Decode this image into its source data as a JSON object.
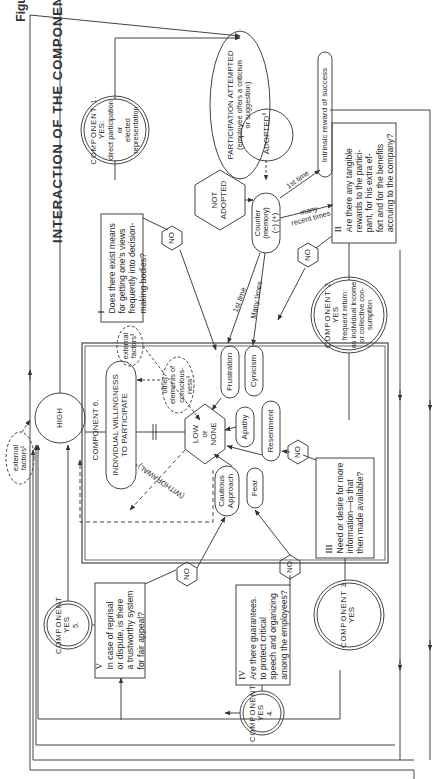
{
  "figure": {
    "label": "Figure 10.1",
    "title": "INTERACTION OF THE COMPONENTS"
  },
  "components": {
    "c1": {
      "arc": "COMPONENT 1.",
      "yes": "YES:",
      "lines": [
        "direct participation",
        "or",
        "elected",
        "representation"
      ]
    },
    "c2": {
      "arc": "COMPONENT 2",
      "yes": "YES",
      "lines": [
        "frequent return:",
        "as individual income",
        "or collective con-",
        "sumption"
      ]
    },
    "c3": {
      "arc": "COMPONENT 3",
      "yes": "YES"
    },
    "c4": {
      "arc": "COMPONENT",
      "yes": "YES",
      "num": "4."
    },
    "c5": {
      "arc": "COMPONENT",
      "yes": "YES",
      "num": "5."
    },
    "c6": {
      "label": "COMPONENT 6.",
      "box_line1": "INDIVIDUAL WILLINGNESS",
      "box_line2": "TO PARTICIPATE"
    }
  },
  "nodes": {
    "participation": {
      "line1": "PARTICIPATION ATTEMPTED",
      "line2": "(employee offers a criticism",
      "line3": "or suggestion)"
    },
    "adopted": "ADOPTED",
    "not_adopted": {
      "line1": "NOT",
      "line2": "ADOPTED"
    },
    "counter": {
      "line1": "Counter",
      "line2": "(memory)",
      "line3": "(−) (+)"
    },
    "intrinsic": "Intrinsic reward of success",
    "high": "HIGH",
    "low_none": {
      "line1": "LOW",
      "line2": "or",
      "line3": "NONE"
    },
    "external_factors_top": {
      "line1": "external",
      "line2": "factors³"
    },
    "external_factors_left": {
      "line1": "external",
      "line2": "factors¹"
    },
    "other_elements": {
      "line1": "other",
      "line2": "elements of",
      "line3": "conscious-",
      "line4": "ness³"
    },
    "withdrawal": "(WITHDRAWAL)⁴",
    "outcomes": [
      "Frustration",
      "Cynicism",
      "Apathy",
      "Resentment",
      "Cautious Approach",
      "Fear"
    ],
    "cautious": {
      "line1": "Cautious",
      "line2": "Approach"
    }
  },
  "questions": {
    "q1": {
      "num": "I",
      "lines": [
        "Does there exist means",
        "for getting one's views",
        "frequently into decision-",
        "making bodies?"
      ]
    },
    "q2": {
      "num": "II",
      "lines": [
        "Are there any tangible",
        "rewards to the partici-",
        "pant, for his extra ef-",
        "fort and for the benefits",
        "accruing to the company?"
      ]
    },
    "q3": {
      "num": "III",
      "lines": [
        "Need or desire for more",
        "information—is that",
        "then made available?"
      ]
    },
    "q4": {
      "num": "IV",
      "lines": [
        "Are there guarantees.",
        "to protect critical",
        "speech and organizing",
        "among the employees?"
      ]
    },
    "q5": {
      "num": "V",
      "lines": [
        "In case of reprisal",
        "or dispute, is there",
        "a trustworthy system",
        "for fair appeal?"
      ]
    }
  },
  "edge_labels": {
    "first_time_top": "1st time",
    "many_recent": {
      "line1": "many",
      "line2": "recent times"
    },
    "first_time_mid": "1st time",
    "many_times": "Many times",
    "no": "NO"
  }
}
